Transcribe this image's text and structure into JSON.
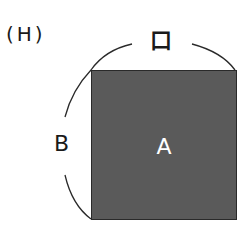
{
  "figure": {
    "label": "(H)",
    "top_dimension_label": "口",
    "left_dimension_label": "B",
    "area_label": "A",
    "shape": "square",
    "fill_color": "#5a5a5a",
    "line_color": "#2a2a2a"
  }
}
